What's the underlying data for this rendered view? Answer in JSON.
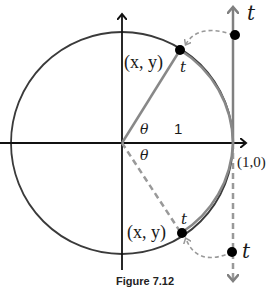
{
  "figure": {
    "caption": "Figure 7.12",
    "labels": {
      "upper_point": "(x, y)",
      "lower_point": "(x, y)",
      "upper_arc_t": "t",
      "lower_arc_t": "t",
      "axis_t": "t",
      "upper_line_t": "t",
      "lower_line_t": "t",
      "theta_upper": "θ",
      "theta_lower": "θ",
      "radius": "1",
      "point_1_0": "(1,0)"
    },
    "colors": {
      "axes": "#111111",
      "circle": "#3a3a3a",
      "t_axis": "#808080",
      "radius_line": "#888888",
      "dashed": "#999999",
      "dot": "#000000"
    }
  }
}
